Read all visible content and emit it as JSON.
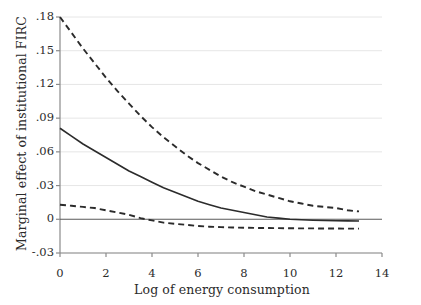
{
  "chart_data": {
    "type": "line",
    "title": "",
    "xlabel": "Log of energy consumption",
    "ylabel": "Marginal effect of institutional FIRC",
    "xlim": [
      0,
      14
    ],
    "ylim": [
      -0.03,
      0.18
    ],
    "xticks": [
      0,
      2,
      4,
      6,
      8,
      10,
      12,
      14
    ],
    "xtick_labels": [
      "0",
      "2",
      "4",
      "6",
      "8",
      "10",
      "12",
      "14"
    ],
    "yticks": [
      -0.03,
      0,
      0.03,
      0.06,
      0.09,
      0.12,
      0.15,
      0.18
    ],
    "ytick_labels": [
      "-.03",
      "0",
      ".03",
      ".06",
      ".09",
      ".12",
      ".15",
      ".18"
    ],
    "grid": "horizontal",
    "legend": "none",
    "zero_reference_line": 0,
    "x": [
      0,
      0.5,
      1,
      1.5,
      2,
      2.5,
      3,
      3.5,
      4,
      4.5,
      5,
      5.5,
      6,
      6.5,
      7,
      7.5,
      8,
      8.5,
      9,
      9.5,
      10,
      10.5,
      11,
      11.5,
      12,
      12.5,
      13
    ],
    "series": [
      {
        "name": "Upper 95% confidence bound",
        "style": "dashed",
        "color": "#2b2b2b",
        "values": [
          0.18,
          0.166,
          0.152,
          0.139,
          0.126,
          0.114,
          0.103,
          0.092,
          0.082,
          0.073,
          0.065,
          0.057,
          0.05,
          0.044,
          0.038,
          0.033,
          0.029,
          0.025,
          0.022,
          0.019,
          0.016,
          0.014,
          0.012,
          0.011,
          0.01,
          0.008,
          0.007
        ]
      },
      {
        "name": "Marginal effect (point estimate)",
        "style": "solid",
        "color": "#2b2b2b",
        "values": [
          0.081,
          0.074,
          0.067,
          0.061,
          0.055,
          0.049,
          0.043,
          0.038,
          0.033,
          0.028,
          0.024,
          0.02,
          0.016,
          0.013,
          0.01,
          0.008,
          0.006,
          0.004,
          0.002,
          0.001,
          0.0,
          -0.0004,
          -0.0008,
          -0.0011,
          -0.0013,
          -0.0014,
          -0.0015
        ]
      },
      {
        "name": "Lower 95% confidence bound",
        "style": "dashed",
        "color": "#2b2b2b",
        "values": [
          0.013,
          0.012,
          0.011,
          0.01,
          0.008,
          0.006,
          0.004,
          0.001,
          -0.001,
          -0.003,
          -0.004,
          -0.005,
          -0.006,
          -0.0066,
          -0.007,
          -0.0073,
          -0.0075,
          -0.0077,
          -0.0078,
          -0.0079,
          -0.008,
          -0.0081,
          -0.0081,
          -0.0082,
          -0.0082,
          -0.0083,
          -0.0083
        ]
      }
    ]
  }
}
